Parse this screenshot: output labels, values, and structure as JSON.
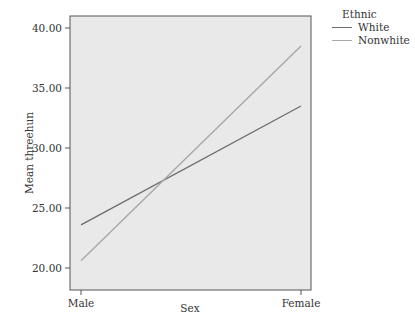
{
  "chart_data": {
    "type": "line",
    "title": "",
    "xlabel": "Sex",
    "ylabel": "Mean threehun",
    "categories": [
      "Male",
      "Female"
    ],
    "ylim": [
      19.2,
      41.0
    ],
    "yticks": [
      "20.00",
      "25.00",
      "30.00",
      "35.00",
      "40.00"
    ],
    "ytick_values": [
      20,
      25,
      30,
      35,
      40
    ],
    "grid": false,
    "legend_position": "right",
    "legend_title": "Ethnic",
    "series": [
      {
        "name": "White",
        "values": [
          23.6,
          33.5
        ],
        "color": "#6e6e6e"
      },
      {
        "name": "Nonwhite",
        "values": [
          20.6,
          38.5
        ],
        "color": "#a8a8a8"
      }
    ]
  },
  "colors": {
    "plot_background": "#e9e9e9",
    "frame": "#555555"
  }
}
